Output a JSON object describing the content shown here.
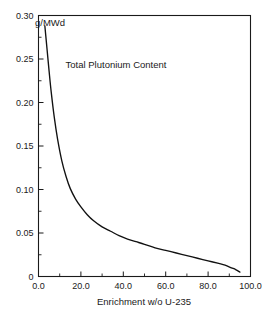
{
  "chart_data": {
    "type": "line",
    "title": "",
    "annotations": [
      {
        "name": "units-label",
        "text": "g/MWd",
        "x_px": 50,
        "y_px": 26
      },
      {
        "name": "series-label",
        "text": "Total Plutonium Content",
        "x_px": 116,
        "y_px": 68
      }
    ],
    "xlabel": "Enrichment w/o U-235",
    "ylabel": "",
    "xlim": [
      0,
      100
    ],
    "ylim": [
      0,
      0.3
    ],
    "grid": false,
    "legend": null,
    "x_ticks": [
      0,
      20,
      40,
      60,
      80,
      100
    ],
    "x_tick_labels": [
      "0.0",
      "20.0",
      "40.0",
      "60.0",
      "80.0",
      "100.0"
    ],
    "x_minor_ticks": [
      10,
      30,
      50,
      70,
      90
    ],
    "y_ticks": [
      0,
      0.05,
      0.1,
      0.15,
      0.2,
      0.25,
      0.3
    ],
    "y_tick_labels": [
      "0",
      "0.05",
      "0.10",
      "0.15",
      "0.20",
      "0.25",
      "0.30"
    ],
    "y_minor_ticks": [
      0.025,
      0.075,
      0.125,
      0.175,
      0.225,
      0.275
    ],
    "series": [
      {
        "name": "Total Plutonium Content",
        "x": [
          3.0,
          4.0,
          5.0,
          6.0,
          7.5,
          9.0,
          11.0,
          13.0,
          15.0,
          17.5,
          20.0,
          23.0,
          26.0,
          30.0,
          34.0,
          38.0,
          42.0,
          46.0,
          50.0,
          55.0,
          60.0,
          65.0,
          70.0,
          75.0,
          80.0,
          85.0,
          88.0,
          91.0,
          93.0,
          95.0
        ],
        "y": [
          0.288,
          0.262,
          0.236,
          0.212,
          0.182,
          0.158,
          0.133,
          0.115,
          0.101,
          0.089,
          0.08,
          0.071,
          0.064,
          0.057,
          0.052,
          0.047,
          0.043,
          0.04,
          0.037,
          0.033,
          0.03,
          0.027,
          0.024,
          0.021,
          0.018,
          0.015,
          0.013,
          0.01,
          0.008,
          0.005
        ]
      }
    ]
  }
}
